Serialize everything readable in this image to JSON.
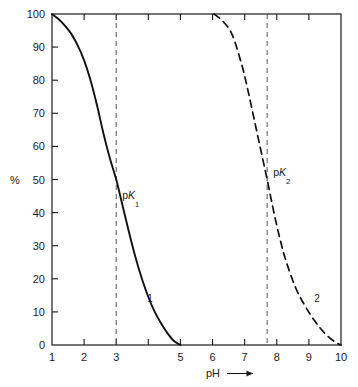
{
  "chart_data": {
    "type": "line",
    "title": "",
    "subtitle": "",
    "xlabel": "pH",
    "xlabel_arrow": "⟶",
    "ylabel": "%",
    "xlim": [
      1,
      10
    ],
    "ylim": [
      0,
      100
    ],
    "grid": false,
    "legend_position": "inline-curve-labels",
    "x_ticks": [
      "1",
      "2",
      "3",
      "4",
      "5",
      "6",
      "7",
      "8",
      "9",
      "10"
    ],
    "x_tick_values": [
      1,
      2,
      3,
      4,
      5,
      6,
      7,
      8,
      9,
      10
    ],
    "x_tick_labels_shown": [
      "1",
      "2",
      "3",
      "5",
      "6",
      "7",
      "8",
      "9",
      "10"
    ],
    "y_ticks": [
      "0",
      "10",
      "20",
      "30",
      "40",
      "50",
      "60",
      "70",
      "80",
      "90",
      "100"
    ],
    "y_tick_values": [
      0,
      10,
      20,
      30,
      40,
      50,
      60,
      70,
      80,
      90,
      100
    ],
    "series": [
      {
        "name": "1",
        "label": "1",
        "style": "solid",
        "color": "#111111",
        "label_x": 4.05,
        "label_y": 13,
        "x": [
          1.0,
          1.2,
          1.4,
          1.6,
          1.8,
          2.0,
          2.2,
          2.4,
          2.6,
          2.8,
          3.0,
          3.2,
          3.4,
          3.6,
          3.8,
          4.0,
          4.2,
          4.4,
          4.6,
          4.8,
          5.0
        ],
        "y": [
          100.0,
          98.5,
          96.5,
          94.0,
          90.5,
          86.0,
          80.0,
          72.5,
          64.0,
          56.5,
          50.0,
          42.0,
          34.0,
          26.5,
          20.0,
          14.5,
          10.0,
          6.5,
          3.5,
          1.2,
          0.0
        ]
      },
      {
        "name": "2",
        "label": "2",
        "style": "dashed",
        "color": "#111111",
        "label_x": 9.25,
        "label_y": 13,
        "x": [
          6.05,
          6.3,
          6.6,
          6.9,
          7.1,
          7.3,
          7.5,
          7.7,
          7.9,
          8.1,
          8.3,
          8.6,
          8.9,
          9.2,
          9.5,
          9.8,
          10.0
        ],
        "y": [
          100.0,
          98.0,
          94.0,
          85.0,
          77.0,
          68.0,
          59.0,
          50.0,
          40.5,
          32.0,
          25.0,
          17.0,
          11.5,
          7.0,
          3.5,
          1.0,
          0.0
        ]
      }
    ],
    "annotations": [
      {
        "id": "pk1",
        "text": "pK",
        "text_prefix": "p",
        "text_italic": "K",
        "subscript": "1",
        "x": 3.0,
        "y": 44,
        "marker_line_x": 3.0,
        "marker_line_style": "dashed"
      },
      {
        "id": "pk2",
        "text": "pK",
        "text_prefix": "p",
        "text_italic": "K",
        "subscript": "2",
        "x": 7.7,
        "y": 51,
        "marker_line_x": 7.7,
        "marker_line_style": "dashed"
      }
    ],
    "vertical_reference_lines": [
      {
        "id": "pk1-line",
        "x": 3.0,
        "style": "dashed",
        "color": "#555555"
      },
      {
        "id": "pk2-line",
        "x": 7.7,
        "style": "dashed",
        "color": "#555555"
      }
    ],
    "colors": {
      "axis": "#1a1a1a",
      "curve": "#111111",
      "reference_line": "#555555",
      "background": "#ffffff"
    }
  }
}
